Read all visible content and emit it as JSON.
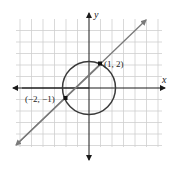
{
  "diagram": {
    "type": "coordinate-graph",
    "axes": {
      "x_label": "x",
      "y_label": "y",
      "grid_range": {
        "x": [
          -6,
          6
        ],
        "y": [
          -6,
          5
        ]
      },
      "grid": true
    },
    "circle": {
      "center": [
        0,
        0
      ],
      "radius_squared": 5
    },
    "line": {
      "slope": 1,
      "intercept": 1
    },
    "points": [
      {
        "label": "(1, 2)",
        "x": 1,
        "y": 2
      },
      {
        "label": "(−2, −1)",
        "x": -2,
        "y": -1
      }
    ],
    "colors": {
      "grid": "#cfcfcf",
      "axes": "#1a1a1a",
      "circle": "#3a3a3a",
      "line": "#7a7a7a",
      "points": "#111111"
    }
  }
}
